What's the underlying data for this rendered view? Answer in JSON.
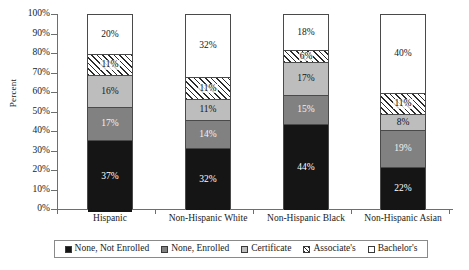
{
  "chart_data": {
    "type": "bar",
    "stacked": true,
    "stacked_mode": "percent",
    "title": "",
    "xlabel": "",
    "ylabel": "Percent",
    "ylim": [
      0,
      100
    ],
    "ytick_step": 10,
    "ytick_labels": [
      "0%",
      "10%",
      "20%",
      "30%",
      "40%",
      "50%",
      "60%",
      "70%",
      "80%",
      "90%",
      "100%"
    ],
    "ytick_values": [
      0,
      10,
      20,
      30,
      40,
      50,
      60,
      70,
      80,
      90,
      100
    ],
    "grid": false,
    "legend_position": "bottom",
    "categories": [
      "Hispanic",
      "Non-Hispanic White",
      "Non-Hispanic Black",
      "Non-Hispanic Asian"
    ],
    "series": [
      {
        "name": "None, Not Enrolled",
        "fill": "black",
        "color": "#151515",
        "values": [
          37,
          32,
          44,
          22
        ],
        "labels": [
          "37%",
          "32%",
          "44%",
          "22%"
        ]
      },
      {
        "name": "None, Enrolled",
        "fill": "darkgray",
        "color": "#818181",
        "values": [
          17,
          14,
          15,
          19
        ],
        "labels": [
          "17%",
          "14%",
          "15%",
          "19%"
        ]
      },
      {
        "name": "Certificate",
        "fill": "lightgray",
        "color": "#bdbdbd",
        "values": [
          16,
          11,
          17,
          8
        ],
        "labels": [
          "16%",
          "11%",
          "17%",
          "8%"
        ]
      },
      {
        "name": "Associate's",
        "fill": "hatch",
        "color": "#ffffff",
        "values": [
          11,
          11,
          6,
          11
        ],
        "labels": [
          "11%",
          "11%",
          "6%",
          "11%"
        ]
      },
      {
        "name": "Bachelor's",
        "fill": "white",
        "color": "#ffffff",
        "values": [
          20,
          32,
          18,
          40
        ],
        "labels": [
          "20%",
          "32%",
          "18%",
          "40%"
        ]
      }
    ]
  },
  "axis": {
    "y_title": "Percent",
    "y_labels": [
      "100%",
      "90%",
      "80%",
      "70%",
      "60%",
      "50%",
      "40%",
      "30%",
      "20%",
      "10%",
      "0%"
    ],
    "x_labels": [
      "Hispanic",
      "Non-Hispanic White",
      "Non-Hispanic Black",
      "Non-Hispanic Asian"
    ]
  },
  "legend": {
    "items": [
      {
        "label": "None, Not Enrolled",
        "swatch": "black"
      },
      {
        "label": "None, Enrolled",
        "swatch": "darkgray"
      },
      {
        "label": "Certificate",
        "swatch": "lightgray"
      },
      {
        "label": "Associate's",
        "swatch": "hatch"
      },
      {
        "label": "Bachelor's",
        "swatch": "white"
      }
    ]
  },
  "bars": [
    {
      "category": "Hispanic",
      "segments_top_to_bottom": [
        {
          "series": "Bachelor's",
          "value": 20,
          "label": "20%",
          "fill": "white"
        },
        {
          "series": "Associate's",
          "value": 11,
          "label": "11%",
          "fill": "hatch"
        },
        {
          "series": "Certificate",
          "value": 16,
          "label": "16%",
          "fill": "lightgray"
        },
        {
          "series": "None, Enrolled",
          "value": 17,
          "label": "17%",
          "fill": "darkgray"
        },
        {
          "series": "None, Not Enrolled",
          "value": 37,
          "label": "37%",
          "fill": "black"
        }
      ]
    },
    {
      "category": "Non-Hispanic White",
      "segments_top_to_bottom": [
        {
          "series": "Bachelor's",
          "value": 32,
          "label": "32%",
          "fill": "white"
        },
        {
          "series": "Associate's",
          "value": 11,
          "label": "11%",
          "fill": "hatch"
        },
        {
          "series": "Certificate",
          "value": 11,
          "label": "11%",
          "fill": "lightgray"
        },
        {
          "series": "None, Enrolled",
          "value": 14,
          "label": "14%",
          "fill": "darkgray"
        },
        {
          "series": "None, Not Enrolled",
          "value": 32,
          "label": "32%",
          "fill": "black"
        }
      ]
    },
    {
      "category": "Non-Hispanic Black",
      "segments_top_to_bottom": [
        {
          "series": "Bachelor's",
          "value": 18,
          "label": "18%",
          "fill": "white"
        },
        {
          "series": "Associate's",
          "value": 6,
          "label": "6%",
          "fill": "hatch"
        },
        {
          "series": "Certificate",
          "value": 17,
          "label": "17%",
          "fill": "lightgray"
        },
        {
          "series": "None, Enrolled",
          "value": 15,
          "label": "15%",
          "fill": "darkgray"
        },
        {
          "series": "None, Not Enrolled",
          "value": 44,
          "label": "44%",
          "fill": "black"
        }
      ]
    },
    {
      "category": "Non-Hispanic Asian",
      "segments_top_to_bottom": [
        {
          "series": "Bachelor's",
          "value": 40,
          "label": "40%",
          "fill": "white"
        },
        {
          "series": "Associate's",
          "value": 11,
          "label": "11%",
          "fill": "hatch"
        },
        {
          "series": "Certificate",
          "value": 8,
          "label": "8%",
          "fill": "lightgray"
        },
        {
          "series": "None, Enrolled",
          "value": 19,
          "label": "19%",
          "fill": "darkgray"
        },
        {
          "series": "None, Not Enrolled",
          "value": 22,
          "label": "22%",
          "fill": "black"
        }
      ]
    }
  ]
}
